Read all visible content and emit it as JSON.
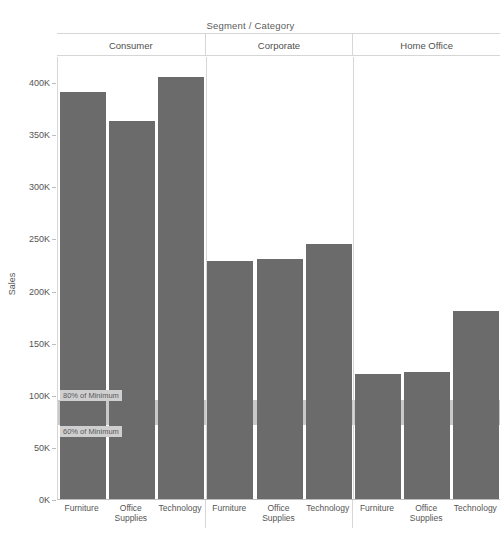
{
  "header": {
    "title": "Segment  /  Category"
  },
  "axis": {
    "y_title": "Sales",
    "y_ticks": [
      "0K",
      "50K",
      "100K",
      "150K",
      "200K",
      "250K",
      "300K",
      "350K",
      "400K"
    ],
    "y_tick_values": [
      0,
      50000,
      100000,
      150000,
      200000,
      250000,
      300000,
      350000,
      400000
    ]
  },
  "reference_lines": [
    {
      "label": "80% of Minimum",
      "value": 96000
    },
    {
      "label": "60% of Minimum",
      "value": 72000
    }
  ],
  "colors": {
    "bar": "#6b6b6b",
    "reference_band": "#c9c9c9",
    "reference_label_bg": "#cfcfcf",
    "grid": "#d6d6d6",
    "axis": "#bdbdbd",
    "text": "#555555",
    "background": "#ffffff"
  },
  "chart_data": {
    "type": "bar",
    "title": "Segment  /  Category",
    "xlabel": "",
    "ylabel": "Sales",
    "ylim": [
      0,
      425000
    ],
    "grid": false,
    "legend": "none",
    "panels": [
      {
        "name": "Consumer",
        "categories": [
          "Furniture",
          "Office Supplies",
          "Technology"
        ],
        "values": [
          390000,
          363000,
          405000
        ]
      },
      {
        "name": "Corporate",
        "categories": [
          "Furniture",
          "Office Supplies",
          "Technology"
        ],
        "values": [
          228000,
          230000,
          245000
        ]
      },
      {
        "name": "Home Office",
        "categories": [
          "Furniture",
          "Office Supplies",
          "Technology"
        ],
        "values": [
          120000,
          122000,
          180000
        ]
      }
    ],
    "reference_bands": [
      {
        "label": "80% of Minimum",
        "value": 96000
      },
      {
        "label": "60% of Minimum",
        "value": 72000
      }
    ]
  }
}
